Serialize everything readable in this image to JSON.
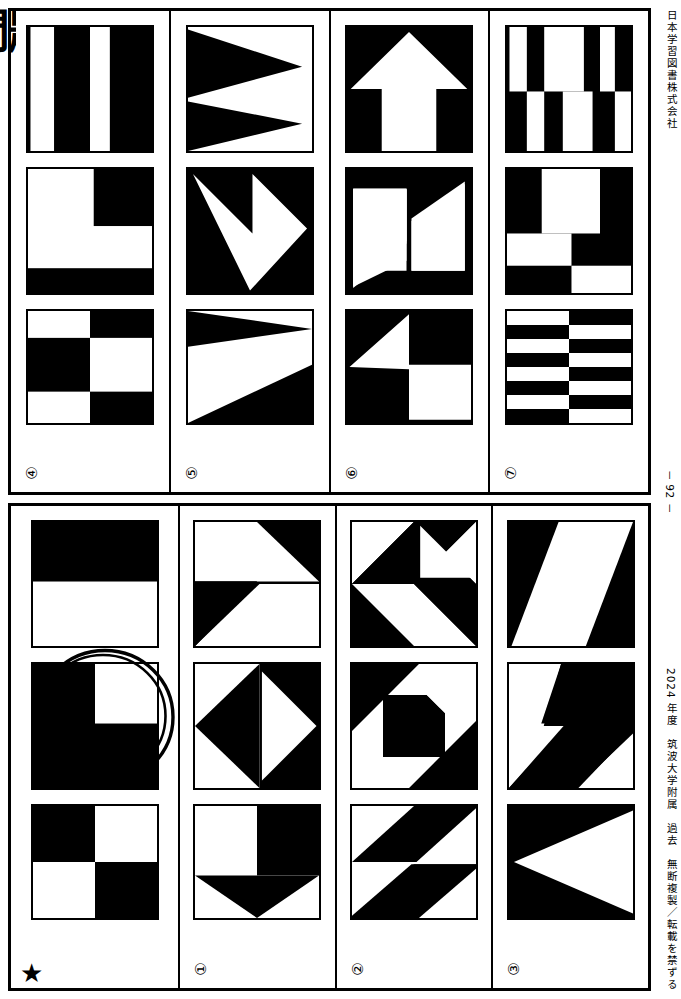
{
  "document": {
    "publisher": "日本学習図書株式会社",
    "copyright": "2024 年度　筑波大学附属　過去　無断複製／転載を禁ずる",
    "page_number": "－ 92 －",
    "bleed_left_text": "問題",
    "ink_color": "#000000",
    "paper_color": "#ffffff"
  },
  "blocks": [
    {
      "id": "block-top",
      "panels": [
        {
          "label": "④",
          "label_kind": "circled-number",
          "figures": [
            {
              "name": "vertical-stripes-two-white-bars",
              "description": "黒地に白い縦帯2本"
            },
            {
              "name": "l-shape-white-with-black-corner",
              "description": "白のL字＋右上黒・下辺黒帯"
            },
            {
              "name": "checker-offset-3x3",
              "description": "市松状の3段パターン"
            }
          ]
        },
        {
          "label": "⑤",
          "label_kind": "circled-number",
          "figures": [
            {
              "name": "two-right-pointing-triangles",
              "description": "右向き黒三角2つ"
            },
            {
              "name": "white-down-arrow-on-black",
              "description": "黒地に白い下向き矢印"
            },
            {
              "name": "two-wedges-diagonal",
              "description": "左上と右下の黒いくさび形"
            }
          ]
        },
        {
          "label": "⑥",
          "label_kind": "circled-number",
          "figures": [
            {
              "name": "white-up-arrow-on-black",
              "description": "黒地に白い上向き矢印"
            },
            {
              "name": "black-diagonal-band",
              "description": "黒の対角帯と白い長方形2つ"
            },
            {
              "name": "white-left-arrow-on-black",
              "description": "黒地に白い左向き矢印"
            }
          ]
        },
        {
          "label": "⑦",
          "label_kind": "circled-number",
          "figures": [
            {
              "name": "offset-vertical-stripes",
              "description": "上下半分で反転した縦縞"
            },
            {
              "name": "blocky-step-pattern",
              "description": "階段状の黒白ブロック"
            },
            {
              "name": "eight-row-checker-stripes",
              "description": "8段の市松縞"
            }
          ]
        }
      ]
    },
    {
      "id": "block-bottom",
      "panels": [
        {
          "label": "★",
          "label_kind": "star",
          "annotation": {
            "name": "hand-drawn-circle",
            "target_figure_index": 1,
            "description": "手書きの二重丸"
          },
          "figures": [
            {
              "name": "top-half-black",
              "description": "上半分が黒"
            },
            {
              "name": "black-square-white-top-right-quadrant",
              "description": "黒の正方形、右上だけ白"
            },
            {
              "name": "checker-2x2",
              "description": "2×2の市松模様"
            }
          ]
        },
        {
          "label": "①",
          "label_kind": "circled-number",
          "figures": [
            {
              "name": "two-opposing-triangles-quadrant",
              "description": "右上と左下に黒三角"
            },
            {
              "name": "black-diamond-with-white-wedge",
              "description": "黒いひし形に白いくさび"
            },
            {
              "name": "white-square-with-black-down-arrow",
              "description": "白い正方形と黒い下向き矢印"
            }
          ]
        },
        {
          "label": "②",
          "label_kind": "circled-number",
          "figures": [
            {
              "name": "pinwheel-four-triangles",
              "description": "4つの三角の風車模様"
            },
            {
              "name": "black-square-in-diagonal-field",
              "description": "対角の中に黒い正方形"
            },
            {
              "name": "two-triangles-rotated",
              "description": "回転した黒三角2つ"
            }
          ]
        },
        {
          "label": "③",
          "label_kind": "circled-number",
          "figures": [
            {
              "name": "white-parallelogram-on-black",
              "description": "黒地に白い平行四辺形"
            },
            {
              "name": "z-shaped-black-band",
              "description": "Z字型の黒い帯"
            },
            {
              "name": "white-left-pointing-triangle",
              "description": "白い左向き三角"
            }
          ]
        }
      ]
    }
  ]
}
